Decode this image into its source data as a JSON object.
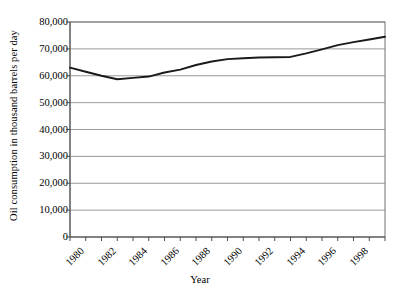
{
  "chart_data": {
    "type": "line",
    "title": "",
    "xlabel": "Year",
    "ylabel": "Oil consumption in thousand barrels per day",
    "ylim": [
      0,
      80000
    ],
    "xlim": [
      1980,
      2000
    ],
    "ytick_labels": [
      "80,000",
      "70,000",
      "60,000",
      "50,000",
      "40,000",
      "30,000",
      "20,000",
      "10,000",
      "0"
    ],
    "ytick_values": [
      80000,
      70000,
      60000,
      50000,
      40000,
      30000,
      20000,
      10000,
      0
    ],
    "xtick_labels": [
      "1980",
      "1982",
      "1984",
      "1986",
      "1988",
      "1990",
      "1992",
      "1994",
      "1996",
      "1998"
    ],
    "xtick_values": [
      1980,
      1982,
      1984,
      1986,
      1988,
      1990,
      1992,
      1994,
      1996,
      1998
    ],
    "grid": "horizontal",
    "legend": "none",
    "line_color": "#1a1a1a",
    "grid_color": "#808080",
    "axis_color": "#4d4d4d",
    "x": [
      1980,
      1981,
      1982,
      1983,
      1984,
      1985,
      1986,
      1987,
      1988,
      1989,
      1990,
      1991,
      1992,
      1993,
      1994,
      1995,
      1996,
      1997,
      1998,
      1999,
      2000
    ],
    "values": [
      63000,
      61500,
      60000,
      58700,
      59200,
      59700,
      61200,
      62300,
      64000,
      65300,
      66200,
      66500,
      66800,
      66900,
      67000,
      68300,
      69800,
      71400,
      72500,
      73500,
      74500
    ],
    "series": [
      {
        "name": "Oil consumption",
        "values": [
          63000,
          61500,
          60000,
          58700,
          59200,
          59700,
          61200,
          62300,
          64000,
          65300,
          66200,
          66500,
          66800,
          66900,
          67000,
          68300,
          69800,
          71400,
          72500,
          73500,
          74500
        ]
      }
    ]
  }
}
